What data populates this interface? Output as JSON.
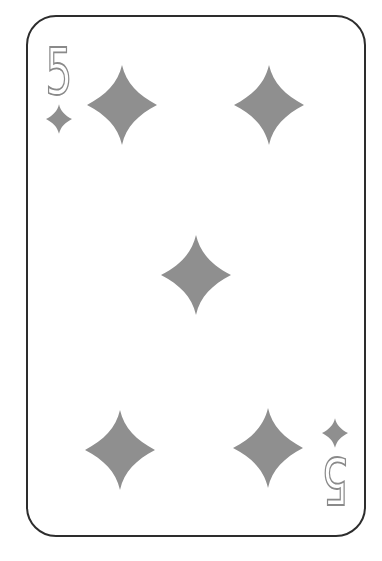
{
  "card": {
    "name": "5 of Diamonds",
    "rank": "5",
    "suit": "diamonds",
    "pip_count": 5,
    "pip_layout": [
      "top-left",
      "top-right",
      "center",
      "bottom-left",
      "bottom-right"
    ],
    "corner_indices": [
      {
        "position": "top-left",
        "rank": "5",
        "suit_icon": "diamond",
        "rotated_180": false
      },
      {
        "position": "bottom-right",
        "rank": "5",
        "suit_icon": "diamond",
        "rotated_180": true
      }
    ],
    "colors": {
      "pip_gray": "#8f8f8f",
      "rank_outline_gray": "#8a8a8a",
      "rank_fill": "#ffffff",
      "card_border": "#2d2d2d",
      "card_background": "#ffffff",
      "page_background": "#ffffff"
    }
  }
}
